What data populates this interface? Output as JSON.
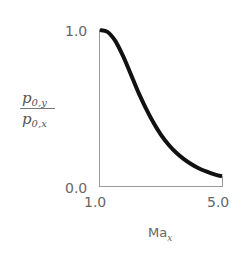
{
  "chart_data": {
    "type": "line",
    "title": "",
    "xlabel": "Ma_x",
    "ylabel": "p_0,y / p_0,x",
    "xlim": [
      1.0,
      5.0
    ],
    "ylim": [
      0.0,
      1.0
    ],
    "x_ticks": [
      "1.0",
      "5.0"
    ],
    "y_ticks": [
      "0.0",
      "1.0"
    ],
    "grid": false,
    "legend": null,
    "series": [
      {
        "name": "stagnation pressure ratio across normal shock",
        "color": "#111111",
        "x": [
          1.0,
          1.25,
          1.5,
          1.75,
          2.0,
          2.25,
          2.5,
          2.75,
          3.0,
          3.25,
          3.5,
          3.75,
          4.0,
          4.25,
          4.5,
          4.75,
          5.0
        ],
        "values": [
          1.0,
          0.987,
          0.93,
          0.835,
          0.721,
          0.604,
          0.499,
          0.407,
          0.328,
          0.265,
          0.213,
          0.172,
          0.139,
          0.112,
          0.092,
          0.075,
          0.062
        ]
      }
    ]
  },
  "axes": {
    "y_tick_top": "1.0",
    "y_tick_bottom": "0.0",
    "x_tick_left": "1.0",
    "x_tick_right": "5.0",
    "x_label_main": "Ma",
    "x_label_sub": "x",
    "y_label_num_main": "p",
    "y_label_num_sub": "0,y",
    "y_label_den_main": "p",
    "y_label_den_sub": "0,x"
  }
}
